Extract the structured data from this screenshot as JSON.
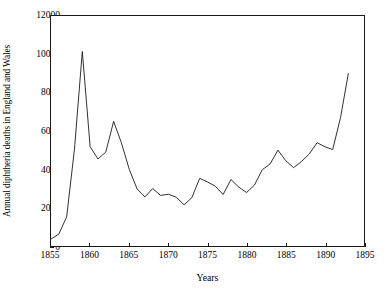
{
  "chart_data": {
    "type": "line",
    "title": "",
    "xlabel": "Years",
    "ylabel": "Annual diphtheria deaths in England and Wales",
    "xlim": [
      1855,
      1895
    ],
    "ylim": [
      0,
      12000
    ],
    "xticks": [
      1855,
      1860,
      1865,
      1870,
      1875,
      1880,
      1885,
      1890,
      1895
    ],
    "yticks": [
      0,
      2000,
      4000,
      6000,
      8000,
      10000,
      12000
    ],
    "xtick_step": 5,
    "ytick_step": 2000,
    "grid": false,
    "legend": null,
    "line_color": "#1a1a1a",
    "background_color": "#ffffff",
    "x": [
      1855,
      1856,
      1857,
      1858,
      1859,
      1860,
      1861,
      1862,
      1863,
      1864,
      1865,
      1866,
      1867,
      1868,
      1869,
      1870,
      1871,
      1872,
      1873,
      1874,
      1875,
      1876,
      1877,
      1878,
      1879,
      1880,
      1881,
      1882,
      1883,
      1884,
      1885,
      1886,
      1887,
      1888,
      1889,
      1890,
      1891,
      1892,
      1893
    ],
    "y": [
      360,
      620,
      1520,
      5050,
      10150,
      5180,
      4540,
      4900,
      6500,
      5380,
      4000,
      2980,
      2560,
      3000,
      2640,
      2700,
      2550,
      2150,
      2520,
      3530,
      3340,
      3120,
      2690,
      3470,
      3070,
      2790,
      3180,
      3980,
      4280,
      5000,
      4450,
      4090,
      4400,
      4800,
      5390,
      5180,
      5030,
      6700,
      9000
    ],
    "series": [
      {
        "name": "Annual diphtheria deaths",
        "values": [
          360,
          620,
          1520,
          5050,
          10150,
          5180,
          4540,
          4900,
          6500,
          5380,
          4000,
          2980,
          2560,
          3000,
          2640,
          2700,
          2550,
          2150,
          2520,
          3530,
          3340,
          3120,
          2690,
          3470,
          3070,
          2790,
          3180,
          3980,
          4280,
          5000,
          4450,
          4090,
          4400,
          4800,
          5390,
          5180,
          5030,
          6700,
          9000
        ]
      }
    ],
    "annotations": []
  },
  "axes": {
    "y_label": "Annual diphtheria deaths in England and Wales",
    "x_label": "Years",
    "y_tick_labels": [
      "0",
      "2000",
      "4000",
      "6000",
      "8000",
      "10000",
      "12000"
    ],
    "x_tick_labels": [
      "1855",
      "1860",
      "1865",
      "1870",
      "1875",
      "1880",
      "1885",
      "1890",
      "1895"
    ]
  }
}
